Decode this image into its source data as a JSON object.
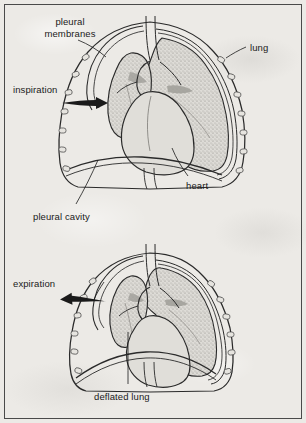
{
  "figure": {
    "background_color": "#eceae6",
    "border_color": "#4a4a4a",
    "ink_color": "#1a1a1a",
    "lung_fill_color": "#c9c7c2"
  },
  "panels": [
    {
      "id": "inspiration-panel",
      "phase_label": "inspiration",
      "arrow_direction": "right"
    },
    {
      "id": "expiration-panel",
      "phase_label": "expiration",
      "arrow_direction": "left"
    }
  ],
  "labels": {
    "pleural_membranes": "pleural\nmembranes",
    "pleural_membranes_line1": "pleural",
    "pleural_membranes_line2": "membranes",
    "lung": "lung",
    "inspiration": "inspiration",
    "heart": "heart",
    "pleural_cavity": "pleural cavity",
    "expiration": "expiration",
    "deflated_lung": "deflated lung"
  }
}
